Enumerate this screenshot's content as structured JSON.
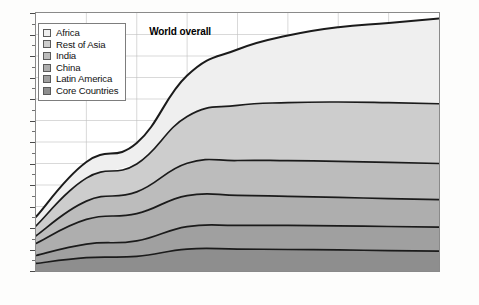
{
  "chart_data": {
    "type": "area",
    "stacked": true,
    "title": "",
    "subtitle": "",
    "xlabel": "",
    "ylabel": "",
    "unit": "billions of people",
    "x": [
      1950,
      1990,
      2000,
      2025,
      2050,
      2075,
      2100,
      2125,
      2150
    ],
    "xtick_labels": [
      "1950",
      "1990",
      "2000",
      "2025",
      "2050",
      "2075",
      "2100",
      "2125",
      "2150"
    ],
    "xticks_evenly_spaced": true,
    "ylim": [
      0,
      12
    ],
    "ytick_labels": [
      "0",
      "1",
      "2",
      "3",
      "4",
      "5",
      "6",
      "7",
      "8",
      "9",
      "10",
      "11",
      "12"
    ],
    "yticks": [
      0,
      1,
      2,
      3,
      4,
      5,
      6,
      7,
      8,
      9,
      10,
      11,
      12
    ],
    "yminor_step": 0.5,
    "grid": "vertical-and-horizontal",
    "legend_position": "upper-left",
    "stack_order_bottom_to_top": [
      "Core Countries",
      "Latin America",
      "China",
      "India",
      "Rest of Asia",
      "Africa"
    ],
    "series": [
      {
        "name": "Core Countries",
        "color": "#8e8e8e",
        "values": [
          0.35,
          0.62,
          0.68,
          1.02,
          1.02,
          1.0,
          0.98,
          0.95,
          0.92
        ]
      },
      {
        "name": "Latin America",
        "color": "#a0a0a0",
        "values": [
          0.37,
          0.63,
          0.72,
          1.04,
          1.1,
          1.12,
          1.12,
          1.12,
          1.12
        ]
      },
      {
        "name": "China",
        "color": "#aeaeae",
        "values": [
          0.56,
          1.15,
          1.27,
          1.45,
          1.4,
          1.35,
          1.32,
          1.3,
          1.28
        ]
      },
      {
        "name": "India",
        "color": "#bcbcbc",
        "values": [
          0.36,
          0.85,
          1.01,
          1.5,
          1.62,
          1.66,
          1.68,
          1.68,
          1.68
        ]
      },
      {
        "name": "Rest of Asia",
        "color": "#cdcdcd",
        "values": [
          0.46,
          1.07,
          1.3,
          2.18,
          2.56,
          2.7,
          2.76,
          2.78,
          2.78
        ]
      },
      {
        "name": "Africa",
        "color": "#efefef",
        "values": [
          0.42,
          0.75,
          0.97,
          1.9,
          2.6,
          3.12,
          3.48,
          3.7,
          3.96
        ]
      }
    ],
    "world_total": [
      2.52,
      5.07,
      5.95,
      9.09,
      10.3,
      10.95,
      11.34,
      11.53,
      11.74
    ],
    "annotations": [
      {
        "text": "World overall",
        "x": 2025,
        "y": 11.1
      }
    ]
  },
  "legend": {
    "items": [
      {
        "label": "Africa",
        "color": "#efefef"
      },
      {
        "label": "Rest of Asia",
        "color": "#cdcdcd"
      },
      {
        "label": "India",
        "color": "#bcbcbc"
      },
      {
        "label": "China",
        "color": "#aeaeae"
      },
      {
        "label": "Latin America",
        "color": "#a0a0a0"
      },
      {
        "label": "Core Countries",
        "color": "#8e8e8e"
      }
    ]
  },
  "style": {
    "frame_color": "#8a8a8a",
    "grid_color": "#bfbfbf",
    "band_edge_color": "#1b1b1b",
    "background": "#ffffff"
  }
}
